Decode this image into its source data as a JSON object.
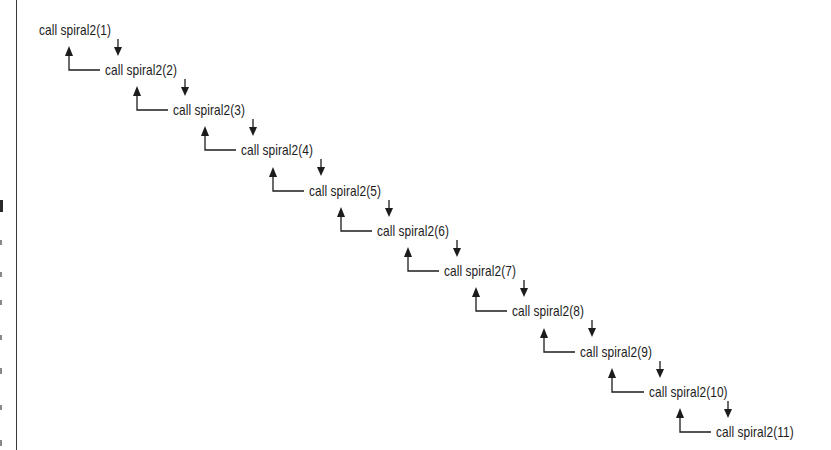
{
  "diagram": {
    "style": {
      "stroke_color": "#1c1c1c",
      "text_color": "#1c1c1c",
      "background": "#ffffff"
    },
    "calls": [
      {
        "label": "call spiral2(1)",
        "depth": 1
      },
      {
        "label": "call spiral2(2)",
        "depth": 2
      },
      {
        "label": "call spiral2(3)",
        "depth": 3
      },
      {
        "label": "call spiral2(4)",
        "depth": 4
      },
      {
        "label": "call spiral2(5)",
        "depth": 5
      },
      {
        "label": "call spiral2(6)",
        "depth": 6
      },
      {
        "label": "call spiral2(7)",
        "depth": 7
      },
      {
        "label": "call spiral2(8)",
        "depth": 8
      },
      {
        "label": "call spiral2(9)",
        "depth": 9
      },
      {
        "label": "call spiral2(10)",
        "depth": 10
      },
      {
        "label": "call spiral2(11)",
        "depth": 11
      }
    ],
    "connectors": {
      "down_arrow": "call-next-level",
      "return_arrow": "return-to-caller"
    }
  }
}
